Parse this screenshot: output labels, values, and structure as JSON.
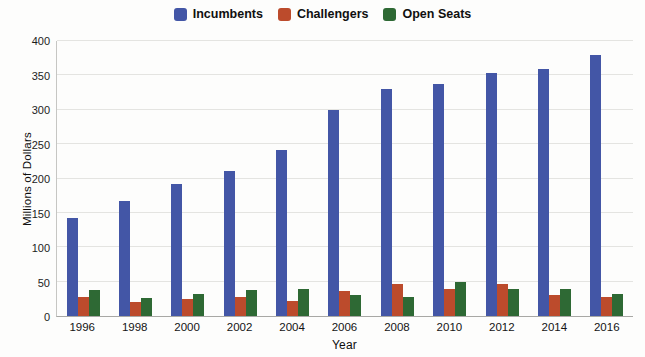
{
  "legend": [
    {
      "label": "Incumbents",
      "color": "#4356a6"
    },
    {
      "label": "Challengers",
      "color": "#bc4b2c"
    },
    {
      "label": "Open Seats",
      "color": "#2e6934"
    }
  ],
  "chart_data": {
    "type": "bar",
    "title": "",
    "xlabel": "Year",
    "ylabel": "Millions of Dollars",
    "categories": [
      "1996",
      "1998",
      "2000",
      "2002",
      "2004",
      "2006",
      "2008",
      "2010",
      "2012",
      "2014",
      "2016"
    ],
    "series": [
      {
        "name": "Incumbents",
        "color": "#4356a6",
        "values": [
          142,
          168,
          192,
          211,
          242,
          300,
          330,
          338,
          354,
          360,
          380
        ]
      },
      {
        "name": "Challengers",
        "color": "#bc4b2c",
        "values": [
          27,
          20,
          25,
          27,
          22,
          36,
          47,
          40,
          47,
          30,
          28
        ]
      },
      {
        "name": "Open Seats",
        "color": "#2e6934",
        "values": [
          38,
          26,
          32,
          38,
          40,
          30,
          28,
          50,
          39,
          40,
          32
        ]
      }
    ],
    "ylim": [
      0,
      400
    ],
    "yticks": [
      0,
      50,
      100,
      150,
      200,
      250,
      300,
      350,
      400
    ],
    "grid": true,
    "legend_position": "top"
  }
}
